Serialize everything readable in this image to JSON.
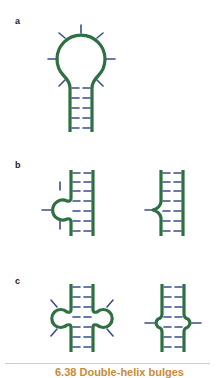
{
  "panels": [
    {
      "label": "a",
      "description": "hairpin loop"
    },
    {
      "label": "b",
      "description": "single-strand bulge, unpaired bulge / kinked bulge"
    },
    {
      "label": "c",
      "description": "internal loops, asymmetric and symmetric"
    }
  ],
  "caption": {
    "text": "6.38  Double-helix bulges"
  },
  "colors": {
    "backbone": "#2e7042",
    "base": "#3a4f8a",
    "divider": "#d9d2a8",
    "caption": "#c98a3a",
    "label": "#222222"
  }
}
